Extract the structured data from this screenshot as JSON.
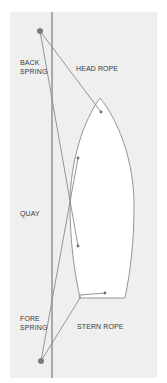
{
  "diagram": {
    "labels": {
      "back_spring_line1": "BACK",
      "back_spring_line2": "SPRING",
      "head_rope": "HEAD ROPE",
      "quay": "QUAY",
      "fore_spring_line1": "FORE",
      "fore_spring_line2": "SPRING",
      "stern_rope": "STERN ROPE"
    },
    "colors": {
      "background": "#efefef",
      "line": "#8a8a8a",
      "quay_line": "#7a7a7a",
      "bollard": "#7d7d7d",
      "boat_fill": "#ffffff"
    }
  }
}
